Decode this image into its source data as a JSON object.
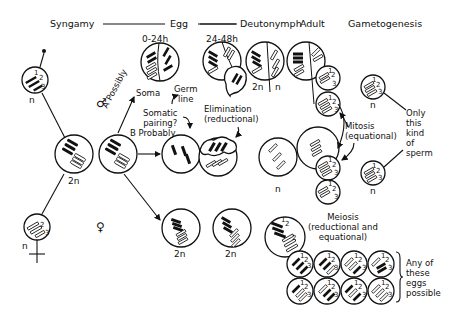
{
  "header": {
    "stages": [
      "Syngamy",
      "Egg",
      "Deutonymph",
      "Adult",
      "Gametogenesis"
    ]
  },
  "labels": {
    "time_0_24": "0-24h",
    "time_24_48": "24-48h",
    "soma": "Soma",
    "germ_line": "Germ\nline",
    "a_possibly": "A Possibly",
    "b_probably": "B Probably",
    "somatic_pairing": "Somatic\npairing?",
    "elimination": "Elimination\n(reductional)",
    "mitosis": "Mitosis\n(equational)",
    "meiosis": "Meiosis\n(reductional and\nequational)",
    "only_sperm": "Only\nthis\nkind\nof\nsperm",
    "any_eggs": "Any of\nthese\neggs\npossible",
    "male_symbol": "♂",
    "female_symbol": "♀",
    "ploidy_n": "n",
    "ploidy_2n": "2n"
  },
  "ploidy_labels": [
    {
      "id": "sperm",
      "text": "n"
    },
    {
      "id": "zygote",
      "text": "2n"
    },
    {
      "id": "egg-gamete",
      "text": "n"
    },
    {
      "id": "deut-2n",
      "text": "2n"
    },
    {
      "id": "deut-n",
      "text": "n"
    },
    {
      "id": "adult-male",
      "text": "n"
    },
    {
      "id": "female-egg1",
      "text": "2n"
    },
    {
      "id": "female-egg2",
      "text": "2n"
    },
    {
      "id": "sperm-top",
      "text": "n"
    },
    {
      "id": "sperm-bottom",
      "text": "n"
    }
  ],
  "chromosome_numbers": [
    "1",
    "2",
    "3"
  ]
}
